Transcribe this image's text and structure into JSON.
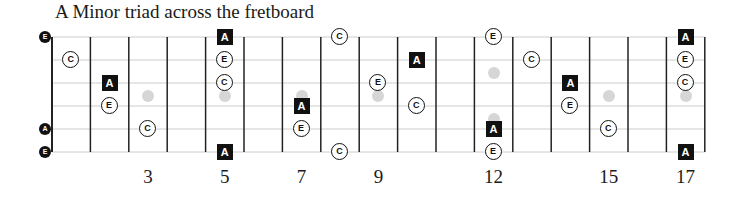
{
  "title": "A Minor triad across the fretboard",
  "colors": {
    "root_box": "#111111",
    "note_border": "#111111",
    "inlay": "#d6d6d6",
    "string_line": "#cccccc",
    "fret_line": "#222222"
  },
  "layout": {
    "nut_x": 52,
    "fret_spacing": 38.4,
    "num_frets": 17,
    "string_y": [
      37,
      60,
      83,
      106,
      129,
      152
    ]
  },
  "fret_numbers": [
    {
      "fret": 3,
      "label": "3"
    },
    {
      "fret": 5,
      "label": "5"
    },
    {
      "fret": 7,
      "label": "7"
    },
    {
      "fret": 9,
      "label": "9"
    },
    {
      "fret": 12,
      "label": "12"
    },
    {
      "fret": 15,
      "label": "15"
    },
    {
      "fret": 17,
      "label": "17"
    }
  ],
  "open_strings": [
    {
      "string": 1,
      "label": "E"
    },
    {
      "string": 5,
      "label": "A"
    },
    {
      "string": 6,
      "label": "E"
    }
  ],
  "inlays": [
    {
      "fret": 3,
      "y": 96
    },
    {
      "fret": 5,
      "y": 96
    },
    {
      "fret": 7,
      "y": 96
    },
    {
      "fret": 9,
      "y": 96
    },
    {
      "fret": 12,
      "y": 73
    },
    {
      "fret": 12,
      "y": 119
    },
    {
      "fret": 15,
      "y": 96
    },
    {
      "fret": 17,
      "y": 96
    }
  ],
  "notes": [
    {
      "fret": 1,
      "string": 2,
      "label": "C",
      "root": false
    },
    {
      "fret": 2,
      "string": 3,
      "label": "A",
      "root": true
    },
    {
      "fret": 2,
      "string": 4,
      "label": "E",
      "root": false
    },
    {
      "fret": 3,
      "string": 5,
      "label": "C",
      "root": false
    },
    {
      "fret": 5,
      "string": 1,
      "label": "A",
      "root": true
    },
    {
      "fret": 5,
      "string": 2,
      "label": "E",
      "root": false
    },
    {
      "fret": 5,
      "string": 3,
      "label": "C",
      "root": false
    },
    {
      "fret": 5,
      "string": 6,
      "label": "A",
      "root": true
    },
    {
      "fret": 7,
      "string": 4,
      "label": "A",
      "root": true
    },
    {
      "fret": 7,
      "string": 5,
      "label": "E",
      "root": false
    },
    {
      "fret": 8,
      "string": 1,
      "label": "C",
      "root": false
    },
    {
      "fret": 8,
      "string": 6,
      "label": "C",
      "root": false
    },
    {
      "fret": 9,
      "string": 3,
      "label": "E",
      "root": false
    },
    {
      "fret": 10,
      "string": 2,
      "label": "A",
      "root": true
    },
    {
      "fret": 10,
      "string": 4,
      "label": "C",
      "root": false
    },
    {
      "fret": 12,
      "string": 1,
      "label": "E",
      "root": false
    },
    {
      "fret": 12,
      "string": 5,
      "label": "A",
      "root": true
    },
    {
      "fret": 12,
      "string": 6,
      "label": "E",
      "root": false
    },
    {
      "fret": 13,
      "string": 2,
      "label": "C",
      "root": false
    },
    {
      "fret": 14,
      "string": 3,
      "label": "A",
      "root": true
    },
    {
      "fret": 14,
      "string": 4,
      "label": "E",
      "root": false
    },
    {
      "fret": 15,
      "string": 5,
      "label": "C",
      "root": false
    },
    {
      "fret": 17,
      "string": 1,
      "label": "A",
      "root": true
    },
    {
      "fret": 17,
      "string": 2,
      "label": "E",
      "root": false
    },
    {
      "fret": 17,
      "string": 3,
      "label": "C",
      "root": false
    },
    {
      "fret": 17,
      "string": 6,
      "label": "A",
      "root": true
    }
  ]
}
